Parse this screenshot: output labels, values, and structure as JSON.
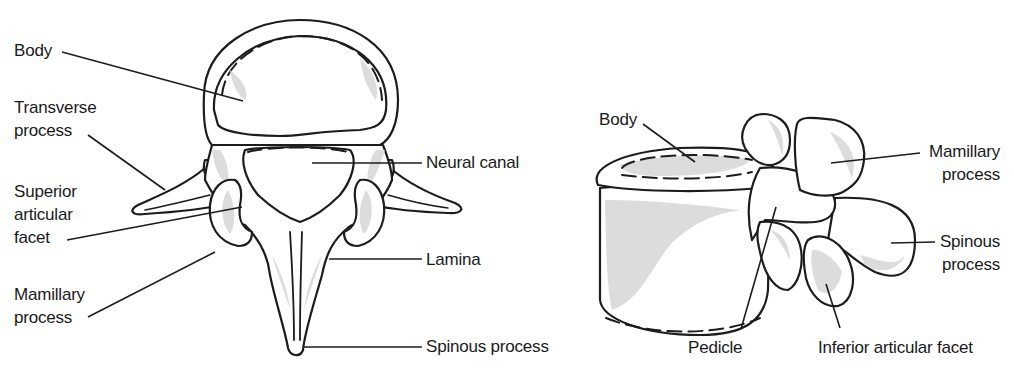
{
  "figure": {
    "views": [
      {
        "name": "superior-view",
        "labels": {
          "body": "Body",
          "transverse_process": "Transverse\nprocess",
          "superior_articular_facet": "Superior\narticular\nfacet",
          "mamillary_process": "Mamillary\nprocess",
          "neural_canal": "Neural canal",
          "lamina": "Lamina",
          "spinous_process": "Spinous process"
        }
      },
      {
        "name": "lateral-view",
        "labels": {
          "body": "Body",
          "mamillary_process": "Mamillary\nprocess",
          "spinous_process": "Spinous\nprocess",
          "pedicle": "Pedicle",
          "inferior_articular_facet": "Inferior articular facet"
        }
      }
    ],
    "colors": {
      "outline": "#1c1c1c",
      "shading": "#dcdcdc",
      "background": "#ffffff"
    }
  }
}
